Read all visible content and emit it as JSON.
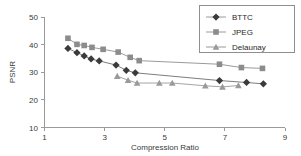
{
  "chart_data": {
    "type": "line",
    "title": "",
    "subtitle": "",
    "xlabel": "Compression Ratio",
    "ylabel": "PSNR",
    "xlim": [
      1,
      9
    ],
    "ylim": [
      10,
      50
    ],
    "xticks": [
      1,
      3,
      5,
      7,
      9
    ],
    "yticks": [
      10,
      20,
      30,
      40,
      50
    ],
    "xtick_labels": [
      "1",
      "3",
      "5",
      "7",
      "9"
    ],
    "ytick_labels": [
      "10",
      "20",
      "30",
      "40",
      "50"
    ],
    "grid": false,
    "legend_position": "top-right",
    "series": [
      {
        "name": "BTTC",
        "marker": "diamond",
        "color": "#3b3b3b",
        "line_color": "#6e6e6e",
        "x": [
          1.78,
          2.08,
          2.32,
          2.55,
          2.82,
          3.38,
          3.72,
          4.02,
          6.82,
          7.72,
          8.28
        ],
        "y": [
          38.6,
          37.1,
          35.9,
          34.8,
          34.1,
          32.6,
          30.7,
          29.8,
          27.0,
          26.3,
          25.8
        ]
      },
      {
        "name": "JPEG",
        "marker": "square",
        "color": "#8c8c8c",
        "line_color": "#8f8f8f",
        "x": [
          1.78,
          2.08,
          2.32,
          2.58,
          2.95,
          3.45,
          3.85,
          4.15,
          6.82,
          7.55,
          8.25
        ],
        "y": [
          42.3,
          40.1,
          39.7,
          39.0,
          38.3,
          37.3,
          35.4,
          34.2,
          32.9,
          31.7,
          31.4
        ]
      },
      {
        "name": "Delaunay",
        "marker": "triangle",
        "color": "#9a9a9a",
        "line_color": "#9a9a9a",
        "x": [
          3.42,
          3.78,
          4.08,
          4.82,
          5.25,
          6.35,
          6.92,
          7.45
        ],
        "y": [
          28.6,
          27.1,
          26.1,
          26.1,
          26.1,
          25.1,
          24.7,
          25.2
        ]
      }
    ],
    "legend_entries": [
      {
        "label": "BTTC",
        "marker": "diamond",
        "color": "#3b3b3b"
      },
      {
        "label": "JPEG",
        "marker": "square",
        "color": "#8c8c8c"
      },
      {
        "label": "Delaunay",
        "marker": "triangle",
        "color": "#9a9a9a"
      }
    ]
  },
  "colors": {
    "background": "#ffffff",
    "axis": "#9a9a9a",
    "text": "#3a3a3a",
    "bttc": "#3b3b3b",
    "jpeg": "#8c8c8c",
    "delaunay": "#9a9a9a"
  }
}
